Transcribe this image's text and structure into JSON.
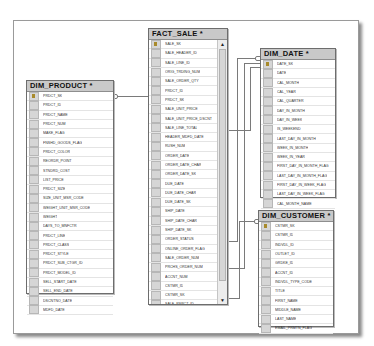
{
  "diagram": {
    "tables": {
      "fact_sale": {
        "title": "FACT_SALE *",
        "columns": [
          "SALE_SK",
          "SALE_HEADER_ID",
          "SALE_LINE_ID",
          "ORIG_TRDING_NUM",
          "SALE_ORDER_QTY",
          "PRDCT_ID",
          "PRDCT_SK",
          "SALE_UNIT_PRICE",
          "SALE_UNIT_PRICE_DSCNT",
          "SALE_LINE_TOTAL",
          "HEADER_MDFD_DATE",
          "RUSH_NUM",
          "ORDER_DATE",
          "ORDER_DATE_CHAR",
          "ORDER_DATE_SK",
          "DUE_DATE",
          "DUE_DATE_CHAR",
          "DUE_DATE_SK",
          "SHIP_DATE",
          "SHIP_DATE_CHAR",
          "SHIP_DATE_SK",
          "ORDER_STATUS",
          "ONLINE_ORDER_FLAG",
          "SALE_ORDER_NUM",
          "PRCHS_ORDER_NUM",
          "ACCNT_NUM",
          "CSTMR_ID",
          "CSTMR_SK",
          "SALE_RSPCT_ID",
          "SRCHL_ID"
        ],
        "key_columns": [
          "SALE_SK"
        ],
        "scroll_up": "▲",
        "scroll_down": "▼"
      },
      "dim_product": {
        "title": "DIM_PRODUCT *",
        "columns": [
          "PRDCT_SK",
          "PRDCT_ID",
          "PRDCT_NAME",
          "PRDCT_NUM",
          "MAKE_FLAG",
          "FNSHD_GOODS_FLAG",
          "PRDCT_COLOR",
          "REORDR_POINT",
          "STNDRD_COST",
          "LIST_PRICE",
          "PRDCT_SIZE",
          "SIZE_UNIT_MSR_CODE",
          "WEIGHT_UNIT_MSR_CODE",
          "WEIGHT",
          "DAYS_TO_MNFCTR",
          "PRDCT_LINE",
          "PRDCT_CLASS",
          "PRDCT_STYLE",
          "PRDCT_SUB_CTGR_ID",
          "PRDCT_MODEL_ID",
          "SELL_START_DATE",
          "SELL_END_DATE",
          "DSCNTNO_DATE",
          "MDFD_DATE"
        ],
        "key_columns": [
          "PRDCT_SK"
        ]
      },
      "dim_date": {
        "title": "DIM_DATE *",
        "columns": [
          "DATE_SK",
          "DATE",
          "CAL_MONTH",
          "CAL_YEAR",
          "CAL_QUARTER",
          "DAY_IN_MONTH",
          "DAY_IN_WEEK",
          "IS_WEEKEND",
          "LAST_DAY_IN_MONTH",
          "WEEK_IN_MONTH",
          "WEEK_IN_YEAR",
          "FIRST_DAY_IN_MONTH_FLAG",
          "LAST_DAY_IN_MONTH_FLAG",
          "FIRST_DAY_IN_WEEK_FLAG",
          "LAST_DAY_IN_WEEK_FLAG",
          "CAL_MONTH_NAME"
        ],
        "key_columns": [
          "DATE_SK"
        ]
      },
      "dim_customer": {
        "title": "DIM_CUSTOMER *",
        "columns": [
          "CSTMR_SK",
          "CSTMR_ID",
          "INDVDL_ID",
          "OUTLET_ID",
          "GRDKE_ID",
          "ACCNT_ID",
          "INDVDL_TYPE_CODE",
          "TITLE",
          "FIRST_NAME",
          "MIDDLE_NAME",
          "LAST_NAME",
          "EMAIL_PRMTN_FLAG"
        ],
        "key_columns": [
          "CSTMR_SK"
        ]
      }
    },
    "relationships": [
      {
        "from": "FACT_SALE.PRDCT_SK",
        "to": "DIM_PRODUCT.PRDCT_SK"
      },
      {
        "from": "FACT_SALE.ORDER_DATE_SK",
        "to": "DIM_DATE.DATE_SK"
      },
      {
        "from": "FACT_SALE.DUE_DATE_SK",
        "to": "DIM_DATE.DATE_SK"
      },
      {
        "from": "FACT_SALE.SHIP_DATE_SK",
        "to": "DIM_DATE.DATE_SK"
      },
      {
        "from": "FACT_SALE.CSTMR_SK",
        "to": "DIM_CUSTOMER.CSTMR_SK"
      }
    ],
    "colors": {
      "header_bg": "#c9c9c9",
      "border": "#6d6d6d",
      "line": "#7a7a7a",
      "key_icon": "#a88a2c"
    }
  }
}
